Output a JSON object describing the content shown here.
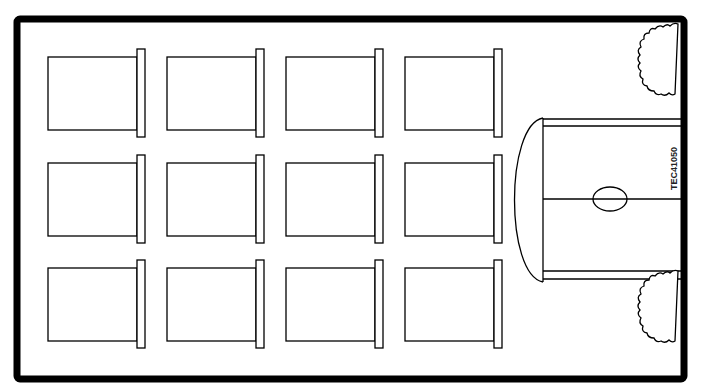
{
  "diagram": {
    "code_label": "TEC41050",
    "room": {
      "x": 16,
      "y": 18,
      "w": 670,
      "h": 362,
      "wall_color": "#000000"
    },
    "desk_grid": {
      "rows": 3,
      "cols": 4,
      "col_x": [
        48,
        167,
        286,
        405
      ],
      "row_y": [
        57,
        163,
        268
      ],
      "desk_w": 89,
      "desk_h": 73,
      "chair_w": 8,
      "chair_h": 88
    },
    "teacher_table": {
      "label": "teacher-desk",
      "has_oval": true
    },
    "trees": 2
  }
}
